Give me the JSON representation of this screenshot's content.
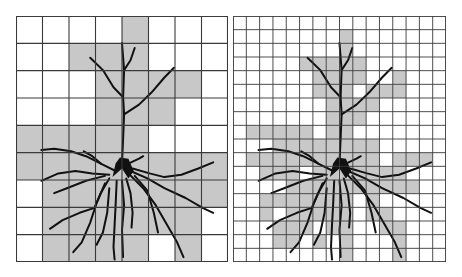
{
  "figure": {
    "colors": {
      "background": "#ffffff",
      "shaded_cell": "#c8c8c8",
      "grid_line": "#3a3a3a",
      "neuron": "#111111"
    },
    "panels": [
      {
        "name": "coarse-grid",
        "x": 16,
        "y": 16,
        "width": 212,
        "height": 246,
        "cols": 8,
        "rows": 9,
        "shaded": [
          [
            4
          ],
          [
            2,
            3,
            4
          ],
          [
            3,
            4,
            5,
            6
          ],
          [
            3,
            4,
            5
          ],
          [
            0,
            1,
            2,
            3,
            4
          ],
          [
            0,
            1,
            2,
            3,
            4,
            5,
            6,
            7
          ],
          [
            1,
            2,
            3,
            4,
            5,
            6,
            7
          ],
          [
            1,
            2,
            3,
            4,
            5,
            6
          ],
          [
            1,
            2,
            3,
            4,
            6
          ]
        ]
      },
      {
        "name": "fine-grid",
        "x": 233,
        "y": 16,
        "width": 213,
        "height": 246,
        "cols": 16,
        "rows": 18,
        "shaded": [
          [],
          [
            8
          ],
          [
            8
          ],
          [
            5,
            6,
            7,
            8,
            9
          ],
          [
            6,
            7,
            8,
            9,
            12
          ],
          [
            6,
            7,
            8,
            10,
            11,
            12
          ],
          [
            7,
            8,
            9,
            10
          ],
          [
            7,
            8,
            9
          ],
          [
            1,
            2,
            3,
            4,
            5,
            7,
            8
          ],
          [
            3,
            4,
            5,
            6,
            7,
            8,
            9,
            10
          ],
          [
            1,
            2,
            3,
            4,
            5,
            6,
            7,
            8,
            9,
            10,
            12,
            13,
            14
          ],
          [
            2,
            3,
            4,
            6,
            7,
            8,
            9,
            10,
            11,
            12
          ],
          [
            4,
            5,
            6,
            7,
            8,
            9,
            10,
            11,
            12,
            13
          ],
          [
            2,
            3,
            4,
            5,
            6,
            7,
            8,
            10
          ],
          [
            2,
            4,
            5,
            6,
            7,
            8,
            10,
            11
          ],
          [
            3,
            4,
            5,
            7,
            8,
            11,
            12
          ],
          [
            3,
            4,
            6,
            8,
            12
          ],
          [
            8,
            12
          ]
        ]
      }
    ]
  }
}
